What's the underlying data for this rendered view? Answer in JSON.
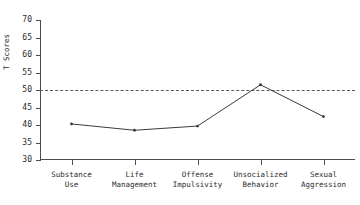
{
  "chart_data": {
    "type": "line",
    "title": "",
    "xlabel": "",
    "ylabel": "T Scores",
    "ylim": [
      30,
      70
    ],
    "yticks": [
      30,
      35,
      40,
      45,
      50,
      55,
      60,
      65,
      70
    ],
    "ytick_labels": [
      "30",
      "35",
      "40",
      "45",
      "50",
      "55",
      "60",
      "65",
      "70"
    ],
    "grid": false,
    "legend": "none",
    "categories": [
      "Substance\nUse",
      "Life\nManagement",
      "Offense\nImpulsivity",
      "Unsocialized\nBehavior",
      "Sexual\nAggression"
    ],
    "category_labels_flat": [
      "Substance Use",
      "Life Management",
      "Offense Impulsivity",
      "Unsocialized Behavior",
      "Sexual Aggression"
    ],
    "series": [
      {
        "name": "T Score",
        "values": [
          40.3,
          38.5,
          39.7,
          51.5,
          42.4
        ],
        "marker": "point",
        "color": "#3a3a3a"
      }
    ],
    "reference_lines": [
      {
        "name": "normative-mean",
        "value": 50,
        "style": "dashed",
        "color": "#5a5a5a"
      }
    ],
    "axis_color": "#4c4c4c",
    "text_color": "#2b2b2b",
    "background": "#ffffff"
  }
}
